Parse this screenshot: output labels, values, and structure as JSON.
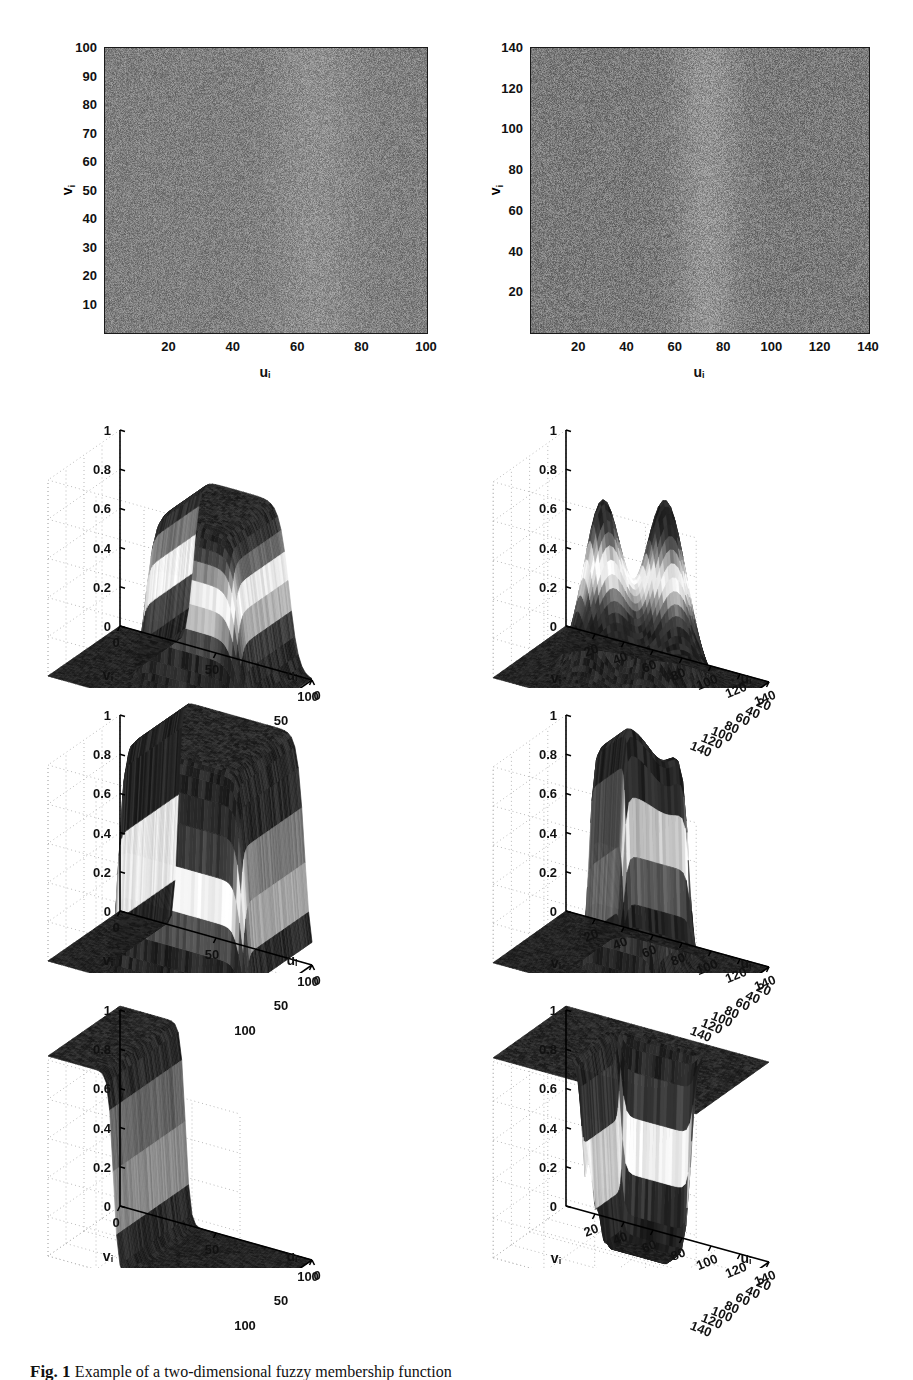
{
  "figure": {
    "caption_label": "Fig. 1",
    "caption_text": "Example of a two-dimensional fuzzy membership function",
    "background": "#ffffff",
    "rows": 4,
    "columns": 2
  },
  "axis_labels": {
    "u": "u",
    "v": "v",
    "subscript": "i"
  },
  "chart_data": [
    {
      "id": "panel-r1c1",
      "type": "heatmap",
      "title": "",
      "xlabel": "u_i",
      "ylabel": "v_i",
      "xlim": [
        0,
        100
      ],
      "ylim": [
        0,
        100
      ],
      "xticks": [
        20,
        40,
        60,
        80,
        100
      ],
      "yticks": [
        10,
        20,
        30,
        40,
        50,
        60,
        70,
        80,
        90,
        100
      ],
      "grid": false,
      "colormap": "gray",
      "description": "Noisy grayscale image, 100x100 pixels, uniform mid-gray speckle with a faint brighter vertical band near u=50-80",
      "mean_level": 0.5,
      "noise_sigma": 0.12,
      "bright_band": {
        "u_start": 50,
        "u_end": 80,
        "amplitude": 0.06
      }
    },
    {
      "id": "panel-r1c2",
      "type": "heatmap",
      "title": "",
      "xlabel": "u_i",
      "ylabel": "v_i",
      "xlim": [
        0,
        140
      ],
      "ylim": [
        0,
        140
      ],
      "xticks": [
        20,
        40,
        60,
        80,
        100,
        120,
        140
      ],
      "yticks": [
        20,
        40,
        60,
        80,
        100,
        120,
        140
      ],
      "grid": false,
      "colormap": "gray",
      "description": "Noisy grayscale image, 140x140 pixels, with a distinct brighter vertical band around u=58-88",
      "mean_level": 0.48,
      "noise_sigma": 0.13,
      "bright_band": {
        "u_start": 58,
        "u_end": 88,
        "amplitude": 0.1
      }
    },
    {
      "id": "panel-r2c1",
      "type": "surface",
      "title": "",
      "xlabel": "u_i",
      "ylabel": "v_i",
      "zlabel": "",
      "xlim": [
        0,
        100
      ],
      "ylim": [
        0,
        100
      ],
      "zlim": [
        0,
        1
      ],
      "xticks": [
        0,
        50,
        100
      ],
      "yticks": [
        100,
        50,
        0
      ],
      "zticks": [
        0,
        0.2,
        0.4,
        0.6,
        0.8,
        1
      ],
      "grid": true,
      "colormap": "gray",
      "shape": "plateau",
      "description": "Flat zero floor with a single broad plateau rising to about 0.85 over the upper-right region, steep front wall",
      "plateau_level": 0.85,
      "floor_level": 0.0,
      "u_edges": [
        38,
        100
      ],
      "v_edges": [
        0,
        70
      ]
    },
    {
      "id": "panel-r2c2",
      "type": "surface",
      "title": "",
      "xlabel": "u_i",
      "ylabel": "v_i",
      "zlabel": "",
      "xlim": [
        0,
        140
      ],
      "ylim": [
        0,
        140
      ],
      "zlim": [
        0,
        1
      ],
      "xticks": [
        20,
        40,
        60,
        80,
        100,
        120,
        140
      ],
      "yticks": [
        140,
        120,
        100,
        80,
        60,
        40,
        20
      ],
      "zticks": [
        0,
        0.2,
        0.4,
        0.6,
        0.8,
        1
      ],
      "grid": true,
      "colormap": "gray",
      "shape": "twin-peaks",
      "description": "Flat zero floor with two separate rounded peaks reaching about 0.9, separated by a narrow valley",
      "peaks": [
        {
          "u": 52,
          "v": 72,
          "height": 0.88,
          "width": 24
        },
        {
          "u": 88,
          "v": 66,
          "height": 0.94,
          "width": 26
        }
      ],
      "floor_level": 0.0
    },
    {
      "id": "panel-r3c1",
      "type": "surface",
      "title": "",
      "xlabel": "u_i",
      "ylabel": "v_i",
      "zlabel": "",
      "xlim": [
        0,
        100
      ],
      "ylim": [
        0,
        100
      ],
      "zlim": [
        0,
        1
      ],
      "xticks": [
        0,
        50,
        100
      ],
      "yticks": [
        100,
        50,
        0
      ],
      "zticks": [
        0,
        0.2,
        0.4,
        0.6,
        0.8,
        1
      ],
      "grid": true,
      "colormap": "gray",
      "shape": "mesa",
      "description": "Tall steep-walled mesa filling most of the domain, top clipped above z=1, surrounded by a flat zero floor",
      "plateau_level": 1.0,
      "floor_level": 0.0,
      "u_edges": [
        30,
        95
      ],
      "v_edges": [
        0,
        85
      ]
    },
    {
      "id": "panel-r3c2",
      "type": "surface",
      "title": "",
      "xlabel": "u_i",
      "ylabel": "v_i",
      "zlabel": "",
      "xlim": [
        0,
        140
      ],
      "ylim": [
        0,
        140
      ],
      "zlim": [
        0,
        1
      ],
      "xticks": [
        20,
        40,
        60,
        80,
        100,
        120,
        140
      ],
      "yticks": [
        140,
        120,
        100,
        80,
        60,
        40,
        20
      ],
      "zticks": [
        0,
        0.2,
        0.4,
        0.6,
        0.8,
        1
      ],
      "grid": true,
      "colormap": "gray",
      "shape": "notched-mesa",
      "description": "Single merged mesa with a notched two-lobe top rising above z=1, steep vertical walls, flat zero floor around it",
      "plateau_level": 1.0,
      "floor_level": 0.0,
      "u_edges": [
        48,
        96
      ],
      "v_edges": [
        30,
        100
      ],
      "notch_depth": 0.12
    },
    {
      "id": "panel-r4c1",
      "type": "surface",
      "title": "",
      "xlabel": "u_i",
      "ylabel": "v_i",
      "zlabel": "",
      "xlim": [
        0,
        100
      ],
      "ylim": [
        0,
        100
      ],
      "zlim": [
        0,
        1
      ],
      "xticks": [
        0,
        50,
        100
      ],
      "yticks": [
        100,
        50,
        0
      ],
      "zticks": [
        0,
        0.2,
        0.4,
        0.6,
        0.8,
        1
      ],
      "grid": true,
      "colormap": "gray",
      "shape": "inverted-step",
      "description": "Complement of the plateau: high flat region at z=1 on the near-left, dropping through a steep sigmoid wall to a flat zero floor over the rest",
      "high_level": 1.0,
      "floor_level": 0.0,
      "step_u": 34
    },
    {
      "id": "panel-r4c2",
      "type": "surface",
      "title": "",
      "xlabel": "u_i",
      "ylabel": "v_i",
      "zlabel": "",
      "xlim": [
        0,
        140
      ],
      "ylim": [
        0,
        140
      ],
      "zlim": [
        0,
        1
      ],
      "xticks": [
        20,
        40,
        60,
        80,
        100,
        120,
        140
      ],
      "yticks": [
        140,
        120,
        100,
        80,
        60,
        40,
        20
      ],
      "zticks": [
        0,
        0.2,
        0.4,
        0.6,
        0.8,
        1
      ],
      "grid": true,
      "colormap": "gray",
      "shape": "plateau-with-well",
      "description": "Complement of the notched mesa: flat high surface at z=1 with a deep rectangular well carved out of the centre reaching down to zero, plus a shallow terrace step at about z=0.72",
      "high_level": 1.0,
      "well_floor": 0.0,
      "terrace_level": 0.72,
      "u_edges": [
        48,
        96
      ],
      "v_edges": [
        30,
        100
      ]
    }
  ],
  "panels": [
    {
      "name": "r1c1",
      "xticks": [
        "20",
        "40",
        "60",
        "80",
        "100"
      ],
      "yticks": [
        "10",
        "20",
        "30",
        "40",
        "50",
        "60",
        "70",
        "80",
        "90",
        "100"
      ]
    },
    {
      "name": "r1c2",
      "xticks": [
        "20",
        "40",
        "60",
        "80",
        "100",
        "120",
        "140"
      ],
      "yticks": [
        "20",
        "40",
        "60",
        "80",
        "100",
        "120",
        "140"
      ]
    },
    {
      "name": "left3d",
      "zticks": [
        "1",
        "0.8",
        "0.6",
        "0.4",
        "0.2",
        "0"
      ],
      "vticks": [
        "100",
        "50",
        "0"
      ],
      "uticks": [
        "0",
        "50",
        "100"
      ]
    },
    {
      "name": "right3d",
      "zticks": [
        "1",
        "0.8",
        "0.6",
        "0.4",
        "0.2",
        "0"
      ],
      "vticks": [
        "140",
        "120",
        "100",
        "80",
        "60",
        "40",
        "20"
      ],
      "uticks": [
        "20",
        "40",
        "60",
        "80",
        "100",
        "120",
        "140"
      ]
    }
  ]
}
